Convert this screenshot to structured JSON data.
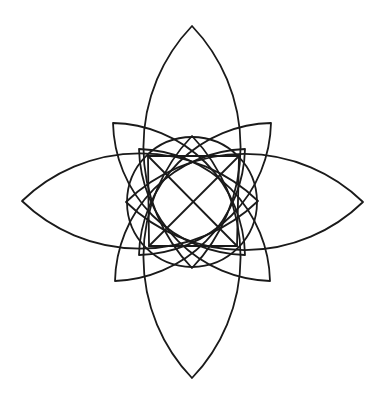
{
  "figure": {
    "background": "#ffffff",
    "stroke_color": "#1a1a1a",
    "stroke_width": 1.8,
    "center": [
      192,
      202
    ],
    "central_circle": {
      "cx": 192,
      "cy": 202,
      "r": 65
    },
    "inner_square": {
      "points": [
        [
          148,
          156
        ],
        [
          239,
          156
        ],
        [
          237,
          246
        ],
        [
          149,
          246
        ]
      ]
    },
    "diagonals": [
      [
        [
          148,
          156
        ],
        [
          237,
          246
        ]
      ],
      [
        [
          239,
          156
        ],
        [
          149,
          246
        ]
      ]
    ],
    "cardinal_lenses": [
      {
        "name": "top",
        "tip_a": [
          192,
          26
        ],
        "tip_b": [
          192,
          268
        ],
        "radius": 175
      },
      {
        "name": "bottom",
        "tip_a": [
          192,
          378
        ],
        "tip_b": [
          192,
          136
        ],
        "radius": 175
      },
      {
        "name": "left",
        "tip_a": [
          22,
          201
        ],
        "tip_b": [
          258,
          201
        ],
        "radius": 170
      },
      {
        "name": "right",
        "tip_a": [
          363,
          202
        ],
        "tip_b": [
          126,
          202
        ],
        "radius": 170
      }
    ],
    "diagonal_lenses": [
      {
        "name": "top-left",
        "tip_a": [
          113,
          123
        ],
        "tip_b": [
          245,
          255
        ],
        "radius": 135
      },
      {
        "name": "top-right",
        "tip_a": [
          271,
          123
        ],
        "tip_b": [
          139,
          255
        ],
        "radius": 135
      },
      {
        "name": "bottom-left",
        "tip_a": [
          115,
          281
        ],
        "tip_b": [
          245,
          149
        ],
        "radius": 135
      },
      {
        "name": "bottom-right",
        "tip_a": [
          270,
          281
        ],
        "tip_b": [
          139,
          149
        ],
        "radius": 135
      }
    ]
  }
}
